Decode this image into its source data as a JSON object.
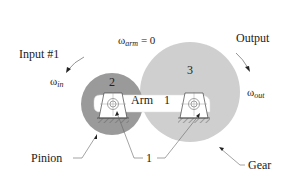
{
  "diagram": {
    "type": "gear train with fixed arm",
    "labels": {
      "input": "Input #1",
      "output": "Output",
      "omega_in_symbol": "ω",
      "omega_in_sub": "in",
      "omega_arm_symbol": "ω",
      "omega_arm_sub": "arm",
      "omega_arm_value": " = 0",
      "omega_out_symbol": "ω",
      "omega_out_sub": "out",
      "pinion_number": "2",
      "gear_number": "3",
      "arm_label": "Arm",
      "arm_number": "1",
      "ground_number": "1",
      "pinion": "Pinion",
      "gear": "Gear"
    },
    "colors": {
      "pinion_fill": "#9a9a9a",
      "gear_fill": "#cfcfcf",
      "arm_fill": "#ffffff",
      "line": "#333333"
    }
  }
}
